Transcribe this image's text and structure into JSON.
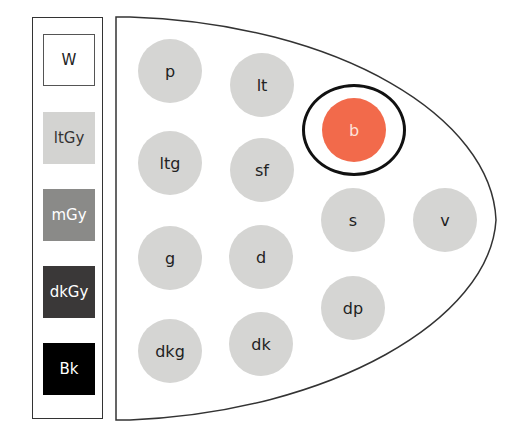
{
  "palette": {
    "swatches": [
      {
        "label": "W",
        "color": "#ffffff",
        "text_color": "#222222",
        "border": "#555555"
      },
      {
        "label": "ltGy",
        "color": "#d3d3d1",
        "text_color": "#333333",
        "border": "none"
      },
      {
        "label": "mGy",
        "color": "#8a8a88",
        "text_color": "#ffffff",
        "border": "none"
      },
      {
        "label": "dkGy",
        "color": "#3a3838",
        "text_color": "#ffffff",
        "border": "none"
      },
      {
        "label": "Bk",
        "color": "#000000",
        "text_color": "#ffffff",
        "border": "none"
      }
    ]
  },
  "board": {
    "dot_color": "#d5d5d3",
    "selected_color": "#f26a4b",
    "selected_label": "b",
    "dots": [
      {
        "label": "p",
        "cx": 170,
        "cy": 71
      },
      {
        "label": "lt",
        "cx": 262,
        "cy": 85
      },
      {
        "label": "b",
        "cx": 354,
        "cy": 130,
        "selected": true
      },
      {
        "label": "ltg",
        "cx": 170,
        "cy": 163
      },
      {
        "label": "sf",
        "cx": 262,
        "cy": 170
      },
      {
        "label": "s",
        "cx": 353,
        "cy": 220
      },
      {
        "label": "v",
        "cx": 445,
        "cy": 220
      },
      {
        "label": "g",
        "cx": 170,
        "cy": 258
      },
      {
        "label": "d",
        "cx": 261,
        "cy": 257
      },
      {
        "label": "dp",
        "cx": 353,
        "cy": 308
      },
      {
        "label": "dkg",
        "cx": 170,
        "cy": 351
      },
      {
        "label": "dk",
        "cx": 261,
        "cy": 344
      }
    ]
  }
}
